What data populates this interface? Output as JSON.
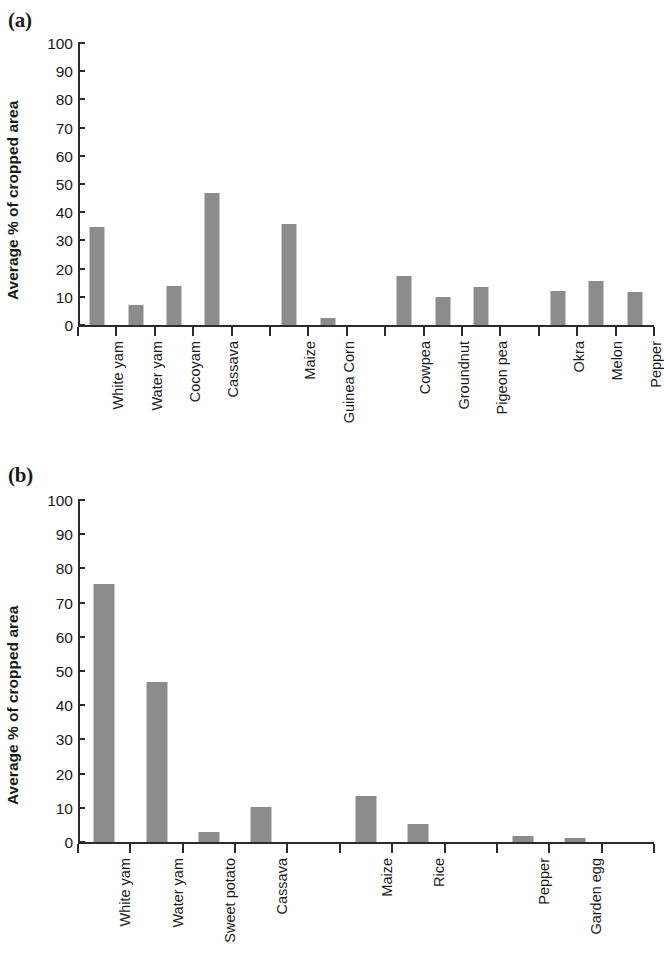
{
  "figure": {
    "panels": [
      {
        "tag": "(a)",
        "ylabel": "Average % of cropped area",
        "chart_key": "a"
      },
      {
        "tag": "(b)",
        "ylabel": "Average % of cropped area",
        "chart_key": "b"
      }
    ],
    "bar_color": "#8c8c8c",
    "axis_color": "#2b2b2b"
  },
  "chart_data": [
    {
      "type": "bar",
      "panel": "(a)",
      "title": "",
      "xlabel": "",
      "ylabel": "Average % of cropped area",
      "ylim": [
        0,
        100
      ],
      "yticks": [
        0,
        10,
        20,
        30,
        40,
        50,
        60,
        70,
        80,
        90,
        100
      ],
      "grid": false,
      "legend": "none",
      "slots": 15,
      "categories": [
        "White yam",
        "Water yam",
        "Cocoyam",
        "Cassava",
        "",
        "Maize",
        "Guinea Corn",
        "",
        "Cowpea",
        "Groundnut",
        "Pigeon pea",
        "",
        "Okra",
        "Melon",
        "Pepper"
      ],
      "values": [
        34.8,
        7.2,
        14.0,
        46.8,
        null,
        35.8,
        2.5,
        null,
        17.5,
        10.0,
        13.5,
        null,
        12.0,
        15.5,
        11.8
      ]
    },
    {
      "type": "bar",
      "panel": "(b)",
      "title": "",
      "xlabel": "",
      "ylabel": "Average % of cropped area",
      "ylim": [
        0,
        100
      ],
      "yticks": [
        0,
        10,
        20,
        30,
        40,
        50,
        60,
        70,
        80,
        90,
        100
      ],
      "grid": false,
      "legend": "none",
      "slots": 11,
      "categories": [
        "White yam",
        "Water yam",
        "Sweet potato",
        "Cassava",
        "",
        "Maize",
        "Rice",
        "",
        "Pepper",
        "Garden egg",
        ""
      ],
      "values": [
        75.5,
        46.7,
        3.0,
        10.2,
        null,
        13.6,
        5.4,
        null,
        1.7,
        1.1,
        null
      ]
    }
  ]
}
